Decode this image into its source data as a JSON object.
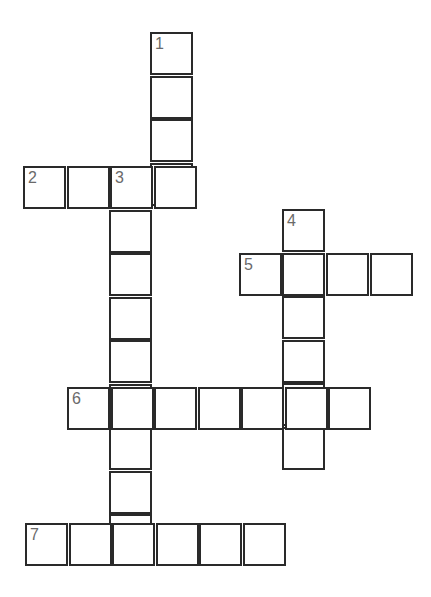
{
  "puzzle": {
    "cell_size": 44,
    "words": [
      {
        "number": "1",
        "direction": "down",
        "x": 150,
        "y": 32,
        "length": 4
      },
      {
        "number": "2",
        "direction": "across",
        "x": 23,
        "y": 166,
        "length": 4
      },
      {
        "number": "3",
        "direction": "down",
        "x": 109,
        "y": 166,
        "length": 9
      },
      {
        "number": "4",
        "direction": "down",
        "x": 282,
        "y": 209,
        "length": 6
      },
      {
        "number": "5",
        "direction": "across",
        "x": 239,
        "y": 253,
        "length": 4
      },
      {
        "number": "6",
        "direction": "across",
        "x": 67,
        "y": 387,
        "length": 7
      },
      {
        "number": "7",
        "direction": "across",
        "x": 25,
        "y": 523,
        "length": 6
      }
    ]
  }
}
